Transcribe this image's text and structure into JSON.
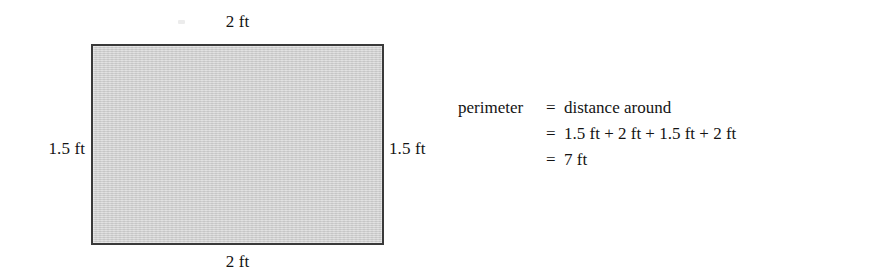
{
  "figure": {
    "type": "rectangle-perimeter-diagram",
    "shape": {
      "name": "shaded-rectangle",
      "fill_color": "#cfcfcf",
      "border_color": "#3a3a3a"
    },
    "dimension_labels": {
      "top": "2 ft",
      "bottom": "2 ft",
      "left": "1.5 ft",
      "right": "1.5 ft"
    }
  },
  "calculation": {
    "lines": [
      {
        "lhs": "perimeter",
        "eq": "=",
        "rhs": "distance around"
      },
      {
        "lhs": "",
        "eq": "=",
        "rhs": "1.5 ft + 2 ft + 1.5 ft + 2 ft"
      },
      {
        "lhs": "",
        "eq": "=",
        "rhs": "7 ft"
      }
    ]
  },
  "chart_data": {
    "type": "diagram",
    "title": "",
    "shape": "rectangle",
    "width_label": "2 ft",
    "height_label": "1.5 ft",
    "width_value": 2,
    "height_value": 1.5,
    "unit": "ft",
    "perimeter_value": 7,
    "perimeter_label": "7 ft",
    "perimeter_expression": "1.5 ft + 2 ft + 1.5 ft + 2 ft",
    "definition": "distance around"
  }
}
